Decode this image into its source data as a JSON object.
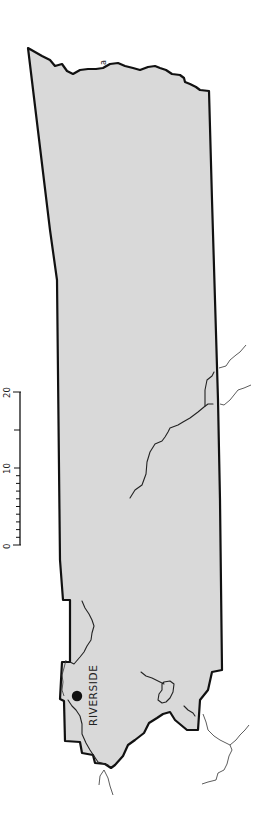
{
  "map": {
    "feature_label": "a",
    "city": {
      "name": "RIVERSIDE",
      "marker": "filled-circle-icon"
    },
    "scale_bar": {
      "labels": [
        "0",
        "10",
        "20"
      ],
      "minor_divisions_first_segment": 10,
      "major_ticks": [
        0,
        10,
        15,
        20
      ]
    },
    "colors": {
      "land_fill": "#d9d9d9",
      "boundary": "#111111",
      "river": "#222222",
      "background": "#ffffff"
    }
  }
}
